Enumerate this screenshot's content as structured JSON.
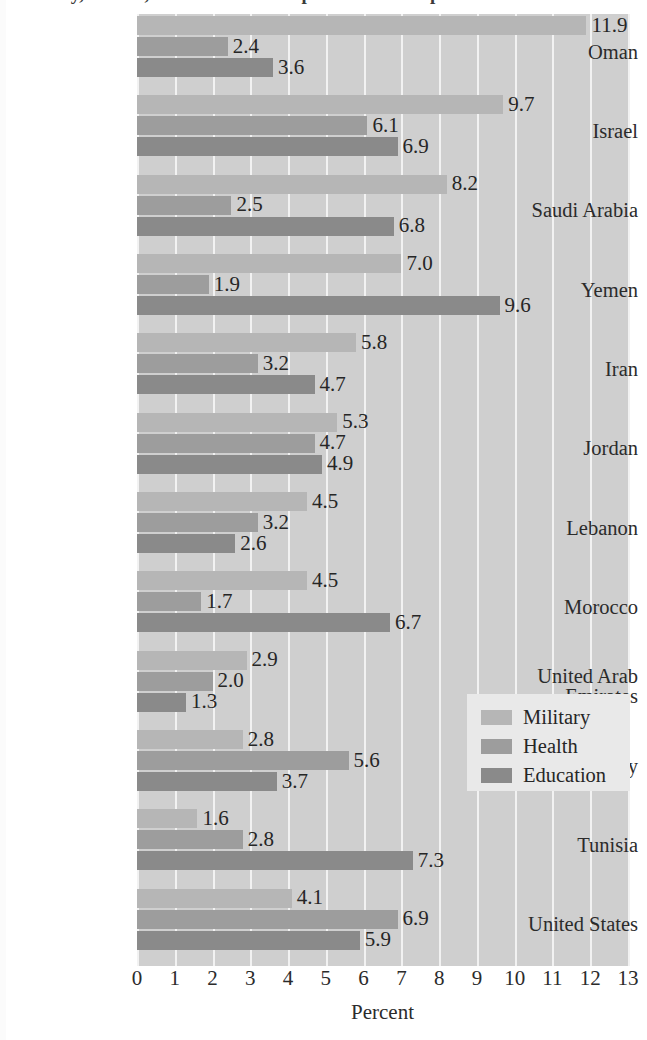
{
  "title": "Military, Health, and Education Expenditures as a percent of GDP",
  "axis": {
    "xlabel": "Percent",
    "xticks": [
      "0",
      "1",
      "2",
      "3",
      "4",
      "5",
      "6",
      "7",
      "8",
      "9",
      "10",
      "11",
      "12",
      "13"
    ],
    "xmin": 0,
    "xmax": 13
  },
  "legend": {
    "entries": [
      {
        "key": "military",
        "label": "Military",
        "color": "#b6b6b6"
      },
      {
        "key": "health",
        "label": "Health",
        "color": "#9d9d9d"
      },
      {
        "key": "education",
        "label": "Education",
        "color": "#8a8a8a"
      }
    ]
  },
  "chart_data": {
    "type": "bar",
    "orientation": "horizontal",
    "title": "Military, Health, and Education Expenditures as a percent of GDP",
    "xlabel": "Percent",
    "ylabel": "",
    "xlim": [
      0,
      13
    ],
    "grid": true,
    "legend_position": "center-right",
    "categories": [
      "Oman",
      "Israel",
      "Saudi Arabia",
      "Yemen",
      "Iran",
      "Jordan",
      "Lebanon",
      "Morocco",
      "United Arab Emirates",
      "Turkey",
      "Tunisia",
      "United States"
    ],
    "series": [
      {
        "name": "Military",
        "color": "#b6b6b6",
        "values": [
          11.9,
          9.7,
          8.2,
          7.0,
          5.8,
          5.3,
          4.5,
          4.5,
          2.9,
          2.8,
          1.6,
          4.1
        ],
        "labels": [
          "11.9",
          "9.7",
          "8.2",
          "7.0",
          "5.8",
          "5.3",
          "4.5",
          "4.5",
          "2.9",
          "2.8",
          "1.6",
          "4.1"
        ]
      },
      {
        "name": "Health",
        "color": "#9d9d9d",
        "values": [
          2.4,
          6.1,
          2.5,
          1.9,
          3.2,
          4.7,
          3.2,
          1.7,
          2.0,
          5.6,
          2.8,
          6.9
        ],
        "labels": [
          "2.4",
          "6.1",
          "2.5",
          "1.9",
          "3.2",
          "4.7",
          "3.2",
          "1.7",
          "2.0",
          "5.6",
          "2.8",
          "6.9"
        ]
      },
      {
        "name": "Education",
        "color": "#8a8a8a",
        "values": [
          3.6,
          6.9,
          6.8,
          9.6,
          4.7,
          4.9,
          2.6,
          6.7,
          1.3,
          3.7,
          7.3,
          5.9
        ],
        "labels": [
          "3.6",
          "6.9",
          "6.8",
          "9.6",
          "4.7",
          "4.9",
          "2.6",
          "6.7",
          "1.3",
          "3.7",
          "7.3",
          "5.9"
        ]
      }
    ]
  },
  "category_display": [
    {
      "lines": [
        "Oman"
      ]
    },
    {
      "lines": [
        "Israel"
      ]
    },
    {
      "lines": [
        "Saudi Arabia"
      ]
    },
    {
      "lines": [
        "Yemen"
      ]
    },
    {
      "lines": [
        "Iran"
      ]
    },
    {
      "lines": [
        "Jordan"
      ]
    },
    {
      "lines": [
        "Lebanon"
      ]
    },
    {
      "lines": [
        "Morocco"
      ]
    },
    {
      "lines": [
        "United Arab",
        "Emirates"
      ]
    },
    {
      "lines": [
        "Turkey"
      ]
    },
    {
      "lines": [
        "Tunisia"
      ]
    },
    {
      "lines": [
        "United States"
      ]
    }
  ]
}
